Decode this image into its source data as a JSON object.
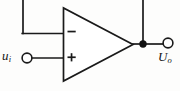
{
  "figure": {
    "kind": "circuit-schematic",
    "name": "operational-amplifier-voltage-follower",
    "background_color": "#fdfdfc",
    "ink_color": "#1a1a1a",
    "width": 180,
    "height": 91
  },
  "labels": {
    "input": {
      "symbol": "u",
      "subscript": "i",
      "full": "ui"
    },
    "output": {
      "symbol": "U",
      "subscript": "o",
      "full": "Uo"
    }
  },
  "opamp": {
    "inverting_sign": "−",
    "noninverting_sign": "+",
    "apex_x": 133,
    "apex_y": 44,
    "left_edge_x": 63,
    "top_y": 8,
    "bottom_y": 81
  },
  "nodes": {
    "input_terminal": {
      "cx": 27,
      "cy": 58,
      "r": 5
    },
    "output_terminal": {
      "cx": 168,
      "cy": 43,
      "r": 5
    },
    "output_junction": {
      "cx": 143,
      "cy": 44,
      "r": 3.6
    }
  },
  "wires": {
    "feedback_label": "feedback-wire",
    "inverting_input_label": "inverting-input-wire",
    "noninverting_input_label": "noninverting-input-wire",
    "output_label": "output-wire"
  }
}
